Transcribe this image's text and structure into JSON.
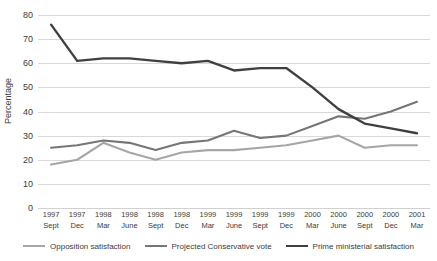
{
  "chart_data": {
    "type": "line",
    "title": "",
    "xlabel": "",
    "ylabel": "Percentage",
    "ylim": [
      0,
      80
    ],
    "ytick_step": 10,
    "grid": true,
    "legend_position": "bottom",
    "categories": [
      "1997 Sept",
      "1997 Dec",
      "1998 Mar",
      "1998 June",
      "1998 Sept",
      "1998 Dec",
      "1999 Mar",
      "1999 June",
      "1999 Sept",
      "1999 Dec",
      "2000 Mar",
      "2000 June",
      "2000 Sept",
      "2000 Dec",
      "2001 Mar"
    ],
    "category_years": [
      "1997",
      "1997",
      "1998",
      "1998",
      "1998",
      "1998",
      "1999",
      "1999",
      "1999",
      "1999",
      "2000",
      "2000",
      "2000",
      "2000",
      "2001"
    ],
    "category_months": [
      "Sept",
      "Dec",
      "Mar",
      "June",
      "Sept",
      "Dec",
      "Mar",
      "June",
      "Sept",
      "Dec",
      "Mar",
      "June",
      "Sept",
      "Dec",
      "Mar"
    ],
    "ytick_labels": [
      "80",
      "70",
      "60",
      "50",
      "40",
      "30",
      "20",
      "10",
      "0"
    ],
    "ytick_values": [
      80,
      70,
      60,
      50,
      40,
      30,
      20,
      10,
      0
    ],
    "series": [
      {
        "name": "Opposition satisfaction",
        "color": "#a6a6a6",
        "values": [
          18,
          20,
          27,
          23,
          20,
          23,
          24,
          24,
          25,
          26,
          28,
          30,
          25,
          26,
          26
        ]
      },
      {
        "name": "Projected Conservative vote",
        "color": "#767676",
        "values": [
          25,
          26,
          28,
          27,
          24,
          27,
          28,
          32,
          29,
          30,
          34,
          38,
          37,
          40,
          44
        ]
      },
      {
        "name": "Prime ministerial satisfaction",
        "color": "#404040",
        "values": [
          76,
          61,
          62,
          62,
          61,
          60,
          61,
          57,
          58,
          58,
          50,
          41,
          35,
          33,
          31
        ]
      }
    ]
  },
  "legend": {
    "items": [
      {
        "label": "Opposition satisfaction",
        "color": "#a6a6a6"
      },
      {
        "label": "Projected Conservative vote",
        "color": "#767676"
      },
      {
        "label": "Prime ministerial satisfaction",
        "color": "#404040"
      }
    ]
  }
}
